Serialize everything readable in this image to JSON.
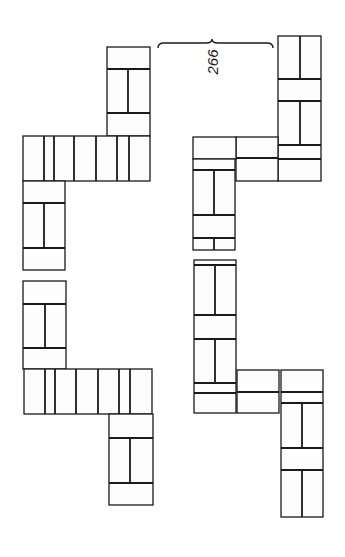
{
  "figure": {
    "label": "266",
    "background": "#ffffff",
    "stroke": "#1a1a1a",
    "brace": {
      "x1": 158,
      "x2": 273,
      "y": 43,
      "mid": 212
    },
    "label_pos": {
      "x": 218,
      "y": 62
    },
    "left_structure": {
      "blocks": [
        {
          "name": "left-top-block",
          "x": 107,
          "y": 47,
          "w": 43,
          "h": 89,
          "hlines": [
            69,
            113
          ],
          "vlines": [
            {
              "x": 128,
              "y1": 69,
              "y2": 113
            }
          ]
        },
        {
          "name": "left-upper-row",
          "x": 23,
          "y": 136,
          "w": 127,
          "h": 45,
          "hlines": [],
          "vlines": [
            {
              "x": 44,
              "y1": 136,
              "y2": 181
            },
            {
              "x": 54,
              "y1": 136,
              "y2": 181
            },
            {
              "x": 74,
              "y1": 136,
              "y2": 181
            },
            {
              "x": 96,
              "y1": 136,
              "y2": 181
            },
            {
              "x": 117,
              "y1": 136,
              "y2": 181
            },
            {
              "x": 129,
              "y1": 136,
              "y2": 181
            }
          ]
        },
        {
          "name": "left-upper-column",
          "x": 23,
          "y": 181,
          "w": 42,
          "h": 89,
          "hlines": [
            203,
            248
          ],
          "vlines": [
            {
              "x": 44,
              "y1": 203,
              "y2": 248
            }
          ]
        },
        {
          "name": "left-lower-column",
          "x": 23,
          "y": 281,
          "w": 43,
          "h": 88,
          "hlines": [
            304,
            348
          ],
          "vlines": [
            {
              "x": 45,
              "y1": 304,
              "y2": 348
            }
          ]
        },
        {
          "name": "left-lower-row",
          "x": 24,
          "y": 369,
          "w": 128,
          "h": 45,
          "hlines": [],
          "vlines": [
            {
              "x": 45,
              "y1": 369,
              "y2": 414
            },
            {
              "x": 55,
              "y1": 369,
              "y2": 414
            },
            {
              "x": 76,
              "y1": 369,
              "y2": 414
            },
            {
              "x": 98,
              "y1": 369,
              "y2": 414
            },
            {
              "x": 119,
              "y1": 369,
              "y2": 414
            },
            {
              "x": 130,
              "y1": 369,
              "y2": 414
            }
          ]
        },
        {
          "name": "left-bottom-block",
          "x": 109,
          "y": 414,
          "w": 44,
          "h": 91,
          "hlines": [
            438,
            483
          ],
          "vlines": [
            {
              "x": 130,
              "y1": 438,
              "y2": 483
            }
          ]
        }
      ]
    },
    "right_structure": {
      "blocks": [
        {
          "name": "right-top-column",
          "x": 278,
          "y": 36,
          "w": 43,
          "h": 145,
          "hlines": [
            79,
            101,
            145,
            159
          ],
          "vlines": [
            {
              "x": 300,
              "y1": 36,
              "y2": 79
            },
            {
              "x": 300,
              "y1": 101,
              "y2": 145
            }
          ]
        },
        {
          "name": "right-upper-row-a",
          "x": 236,
          "y": 137,
          "w": 42,
          "h": 44,
          "hlines": [
            158
          ],
          "vlines": []
        },
        {
          "name": "right-upper-row-b",
          "x": 193,
          "y": 137,
          "w": 43,
          "h": 22,
          "hlines": [],
          "vlines": []
        },
        {
          "name": "right-upper-column",
          "x": 193,
          "y": 159,
          "w": 42,
          "h": 91,
          "hlines": [
            170,
            215,
            238
          ],
          "vlines": [
            {
              "x": 214,
              "y1": 170,
              "y2": 215
            },
            {
              "x": 214,
              "y1": 238,
              "y2": 250
            }
          ]
        },
        {
          "name": "right-lower-column",
          "x": 194,
          "y": 260,
          "w": 42,
          "h": 153,
          "hlines": [
            265,
            315,
            339,
            383,
            393
          ],
          "vlines": [
            {
              "x": 215,
              "y1": 265,
              "y2": 315
            },
            {
              "x": 215,
              "y1": 339,
              "y2": 383
            }
          ]
        },
        {
          "name": "right-lower-row",
          "x": 237,
          "y": 370,
          "w": 42,
          "h": 43,
          "hlines": [
            392
          ],
          "vlines": []
        },
        {
          "name": "right-bottom-column",
          "x": 281,
          "y": 370,
          "w": 42,
          "h": 147,
          "hlines": [
            392,
            403,
            448,
            470
          ],
          "vlines": [
            {
              "x": 302,
              "y1": 403,
              "y2": 448
            },
            {
              "x": 302,
              "y1": 470,
              "y2": 517
            }
          ]
        }
      ]
    }
  }
}
